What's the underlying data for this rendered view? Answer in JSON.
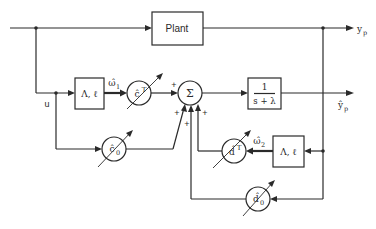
{
  "diagram": {
    "blocks": {
      "plant": {
        "label": "Plant"
      },
      "filter1": {
        "label": "Λ, ℓ"
      },
      "filter2": {
        "label": "Λ, ℓ"
      },
      "model": {
        "numerator": "1",
        "denominator": "s + λ"
      }
    },
    "gains": {
      "c": {
        "label": "ĉ",
        "sup": "T"
      },
      "c0": {
        "label": "ĉ",
        "sub": "0"
      },
      "d": {
        "label": "d̂",
        "sup": "T"
      },
      "d0": {
        "label": "d̂",
        "sub": "0"
      }
    },
    "summer": {
      "label": "Σ"
    },
    "signals": {
      "input": "u",
      "omega1": "ω̂",
      "omega1_sub": "1",
      "omega2": "ω̂",
      "omega2_sub": "2",
      "output": "y",
      "output_sub": "p",
      "estimate": "ŷ",
      "estimate_sub": "p"
    },
    "signs": {
      "c_in": "+",
      "c0_in": "+",
      "d0_in": "+",
      "d_in": "+"
    }
  }
}
